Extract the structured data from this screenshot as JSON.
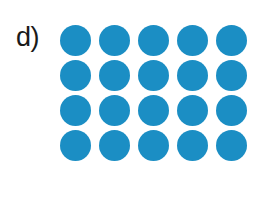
{
  "figure": {
    "panel_label": "d)",
    "background_color": "#ffffff",
    "label_color": "#1a1a1a"
  },
  "chart_data": {
    "type": "scatter",
    "title": "d)",
    "xlabel": "",
    "ylabel": "",
    "marker": {
      "shape": "circle",
      "color": "#1b8ec4",
      "diameter_px": 31,
      "filled": true
    },
    "grid": {
      "rows": 4,
      "columns": 5,
      "total_markers": 20,
      "column_pitch_px": 39,
      "row_pitch_px": 35,
      "origin_px": [
        60,
        25
      ],
      "grid_lines_visible": false
    },
    "legend": null,
    "x": [
      0,
      1,
      2,
      3,
      4,
      0,
      1,
      2,
      3,
      4,
      0,
      1,
      2,
      3,
      4,
      0,
      1,
      2,
      3,
      4
    ],
    "y": [
      3,
      3,
      3,
      3,
      3,
      2,
      2,
      2,
      2,
      2,
      1,
      1,
      1,
      1,
      1,
      0,
      0,
      0,
      0,
      0
    ],
    "values": [
      1,
      1,
      1,
      1,
      1,
      1,
      1,
      1,
      1,
      1,
      1,
      1,
      1,
      1,
      1,
      1,
      1,
      1,
      1,
      1
    ],
    "rows": [
      {
        "index": 0,
        "count": 5
      },
      {
        "index": 1,
        "count": 5
      },
      {
        "index": 2,
        "count": 5
      },
      {
        "index": 3,
        "count": 5
      }
    ],
    "colors": {
      "marker": "#1b8ec4",
      "background": "#ffffff",
      "label": "#1a1a1a"
    }
  }
}
